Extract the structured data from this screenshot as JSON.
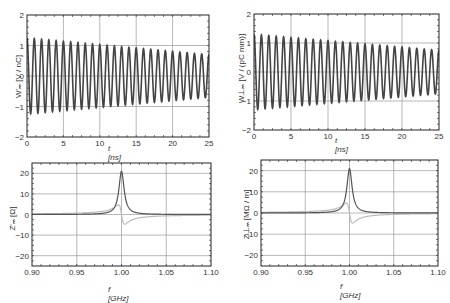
{
  "chart_data": [
    {
      "id": "tl",
      "type": "line",
      "title": "",
      "xlabel": "t [ns]",
      "ylabel": "W'_m [V / nC]",
      "xlim": [
        0,
        25
      ],
      "ylim": [
        -2,
        2
      ],
      "xticks": [
        0,
        5,
        10,
        15,
        20,
        25
      ],
      "yticks": [
        -2,
        -1,
        0,
        1,
        2
      ],
      "grid": true,
      "series": [
        {
          "name": "wake potential",
          "description": "damped oscillation ~1 GHz",
          "amplitude_start": 1.25,
          "amplitude_end": 0.7,
          "frequency_GHz": 1.0,
          "color": "#444444"
        }
      ]
    },
    {
      "id": "tr",
      "type": "line",
      "title": "",
      "xlabel": "t [ns]",
      "ylabel": "W⊥_m [V / (pC mm)]",
      "xlim": [
        0,
        25
      ],
      "ylim": [
        -2,
        2
      ],
      "xticks": [
        0,
        5,
        10,
        15,
        20,
        25
      ],
      "yticks": [
        -2,
        -1,
        0,
        1,
        2
      ],
      "grid": true,
      "series": [
        {
          "name": "transverse wake potential",
          "description": "damped oscillation ~1 GHz",
          "amplitude_start": 1.3,
          "amplitude_end": 0.75,
          "frequency_GHz": 1.0,
          "color": "#444444"
        }
      ]
    },
    {
      "id": "bl",
      "type": "line",
      "title": "",
      "xlabel": "f [GHz]",
      "ylabel": "Z'_m [Ω]",
      "xlim": [
        0.9,
        1.1
      ],
      "ylim": [
        -25,
        25
      ],
      "xticks": [
        "0.90",
        "0.95",
        "1.00",
        "1.05",
        "1.10"
      ],
      "yticks": [
        -20,
        -10,
        0,
        10,
        20
      ],
      "grid": true,
      "series": [
        {
          "name": "Re Z",
          "peak_f": 1.0,
          "peak_value": 21,
          "color": "#555555"
        },
        {
          "name": "Im Z",
          "max": 10,
          "min": -9,
          "color": "#bbbbbb"
        }
      ]
    },
    {
      "id": "br",
      "type": "line",
      "title": "",
      "xlabel": "f [GHz]",
      "ylabel": "Z⊥_m [MΩ / m]",
      "xlim": [
        0.9,
        1.1
      ],
      "ylim": [
        -25,
        25
      ],
      "xticks": [
        "0.90",
        "0.95",
        "1.00",
        "1.05",
        "1.10"
      ],
      "yticks": [
        -20,
        -10,
        0,
        10,
        20
      ],
      "grid": true,
      "series": [
        {
          "name": "Re Z",
          "peak_f": 1.0,
          "peak_value": 21,
          "color": "#555555"
        },
        {
          "name": "Im Z",
          "max": 10,
          "min": -9,
          "color": "#bbbbbb"
        }
      ]
    }
  ],
  "labels": {
    "tl": {
      "ylabel": "W'ₘ [V / nC]",
      "xlabel": "t [ns]"
    },
    "tr": {
      "ylabel": "W⊥ₘ [V / (pC mm)]",
      "xlabel": "t [ns]"
    },
    "bl": {
      "ylabel": "Z'ₘ [Ω]",
      "xlabel": "f [GHz]"
    },
    "br": {
      "ylabel": "Z⊥ₘ [MΩ / m]",
      "xlabel": "f [GHz]"
    }
  },
  "colors": {
    "frame": "#222222",
    "grid": "#888888",
    "wake": "#444444",
    "re": "#555555",
    "im": "#bbbbbb"
  }
}
